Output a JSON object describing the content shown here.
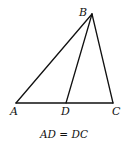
{
  "figure": {
    "type": "triangle-with-median",
    "points": {
      "A": {
        "label": "A",
        "x": 16,
        "y": 103
      },
      "B": {
        "label": "B",
        "x": 92,
        "y": 14
      },
      "C": {
        "label": "C",
        "x": 113,
        "y": 103
      },
      "D": {
        "label": "D",
        "x": 66,
        "y": 103
      }
    },
    "segments": [
      "AB",
      "BC",
      "AC",
      "BD"
    ],
    "caption": "AD = DC",
    "colors": {
      "stroke": "#111111",
      "background": "#ffffff"
    }
  }
}
